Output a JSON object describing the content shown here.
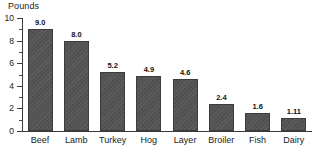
{
  "chart_data": {
    "type": "bar",
    "title": "",
    "ylabel": "Pounds",
    "xlabel": "",
    "categories": [
      "Beef",
      "Lamb",
      "Turkey",
      "Hog",
      "Layer",
      "Broiler",
      "Fish",
      "Dairy"
    ],
    "values": [
      9.0,
      8.0,
      5.2,
      4.9,
      4.6,
      2.4,
      1.6,
      1.11
    ],
    "value_labels": [
      "9.0",
      "8.0",
      "5.2",
      "4.9",
      "4.6",
      "2.4",
      "1.6",
      "1.11"
    ],
    "ylim": [
      0,
      10
    ],
    "y_major_ticks": [
      0,
      2,
      4,
      6,
      8,
      10
    ],
    "y_tick_labels": [
      "0",
      "2",
      "4",
      "6",
      "8",
      "10"
    ],
    "y_minor_ticks": [
      1,
      3,
      5,
      7,
      9
    ],
    "grid": false,
    "legend": null,
    "bar_color": "#555555",
    "axis_color": "#3a3a3a",
    "text_color": "#1a1a1a"
  }
}
